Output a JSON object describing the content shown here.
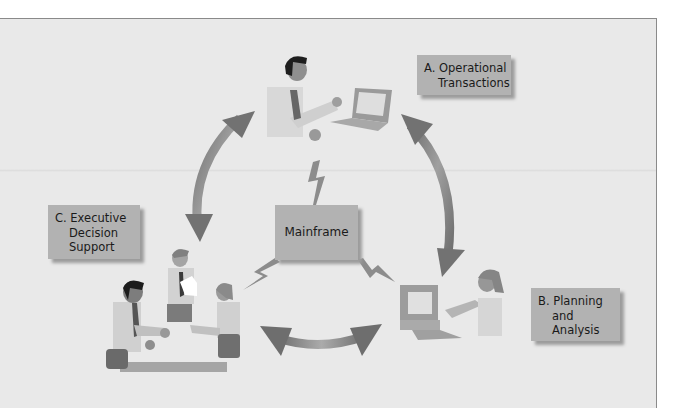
{
  "diagram": {
    "center": {
      "label": "Mainframe"
    },
    "nodes": [
      {
        "id": "A",
        "lines": [
          "A. Operational",
          "Transactions"
        ],
        "figure": "person-with-laptop"
      },
      {
        "id": "B",
        "lines": [
          "B. Planning",
          "and",
          "Analysis"
        ],
        "figure": "person-at-desktop-computer"
      },
      {
        "id": "C",
        "lines": [
          "C. Executive",
          "Decision",
          "Support"
        ],
        "figure": "three-people-meeting-at-table"
      }
    ],
    "connections": [
      {
        "from": "Mainframe",
        "to": "A",
        "type": "lightning"
      },
      {
        "from": "Mainframe",
        "to": "B",
        "type": "lightning"
      },
      {
        "from": "Mainframe",
        "to": "C",
        "type": "lightning"
      },
      {
        "from": "A",
        "to": "C",
        "type": "double-arrow"
      },
      {
        "from": "A",
        "to": "B",
        "type": "double-arrow"
      },
      {
        "from": "B",
        "to": "C",
        "type": "double-arrow"
      }
    ],
    "colors": {
      "background": "#e9e9e9",
      "box": "#b2b2b2",
      "arrow_dark": "#6e6e6e",
      "arrow_light": "#a8a8a8"
    }
  }
}
